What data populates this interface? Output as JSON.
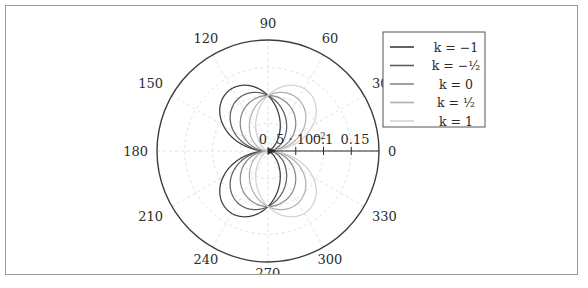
{
  "figure": {
    "type": "polar-plot",
    "background": "#ffffff",
    "frame_color": "#9a9a9a"
  },
  "chart_data": {
    "type": "line",
    "subtype": "polar",
    "title": "",
    "xlabel": "",
    "ylabel": "",
    "grid": true,
    "legend_position": "top-right",
    "polar": {
      "center_x": 267,
      "center_y": 150,
      "outer_radius": 111,
      "r_max": 0.2,
      "angle_direction": "counterclockwise",
      "angle_zero_at": "east"
    },
    "angle_ticks_deg": [
      0,
      30,
      60,
      90,
      120,
      150,
      180,
      210,
      240,
      270,
      300,
      330
    ],
    "angle_tick_labels": [
      "0",
      "30",
      "60",
      "90",
      "120",
      "150",
      "180",
      "210",
      "240",
      "270",
      "300",
      "330"
    ],
    "radial_ticks": [
      0,
      0.05,
      0.1,
      0.15
    ],
    "radial_tick_labels": [
      "0",
      "5 · 10⁻²",
      "0.1",
      "0.15"
    ],
    "radial_tick_label_parts": [
      {
        "text": "0"
      },
      {
        "mantissa": "5 · 10",
        "exponent": "−2"
      },
      {
        "text": "0.1"
      },
      {
        "text": "0.15"
      }
    ],
    "series": [
      {
        "name": "k = -1",
        "legend_label": "k = −1",
        "k": -1,
        "color": "#3d3d3d",
        "amplitude": 0.1,
        "description": "cardioid opening toward 180 degrees, largest lobe"
      },
      {
        "name": "k = -1/2",
        "legend_label": "k = −¹⁄₂",
        "k": -0.5,
        "color": "#5f5f5f",
        "amplitude": 0.1,
        "description": "lobe toward 180 degrees, medium"
      },
      {
        "name": "k = 0",
        "legend_label": "k = 0",
        "k": 0,
        "color": "#888888",
        "amplitude": 0.1,
        "description": "symmetric figure-eight, circle pair"
      },
      {
        "name": "k = 1/2",
        "legend_label": "k = ¹⁄₂",
        "k": 0.5,
        "color": "#b0b0b0",
        "amplitude": 0.1,
        "description": "lobe toward 0 degrees, medium"
      },
      {
        "name": "k = 1",
        "legend_label": "k = 1",
        "k": 1,
        "color": "#d2d2d2",
        "amplitude": 0.1,
        "description": "cardioid opening toward 0 degrees, largest lobe"
      }
    ],
    "legend_entries": [
      {
        "label_k": "k",
        "label_eq": "=",
        "label_val": "−1"
      },
      {
        "label_k": "k",
        "label_eq": "=",
        "label_val": "−¹⁄₂"
      },
      {
        "label_k": "k",
        "label_eq": "=",
        "label_val": "0"
      },
      {
        "label_k": "k",
        "label_eq": "=",
        "label_val": "¹⁄₂"
      },
      {
        "label_k": "k",
        "label_eq": "=",
        "label_val": "1"
      }
    ]
  },
  "legend": {
    "box_color": "#555555",
    "items": [
      {
        "text": "k = −1"
      },
      {
        "text": "k = −¹⁄₂"
      },
      {
        "text": "k = 0"
      },
      {
        "text": "k = ¹⁄₂"
      },
      {
        "text": "k = 1"
      }
    ]
  },
  "angles": {
    "a0": "0",
    "a30": "30",
    "a60": "60",
    "a90": "90",
    "a120": "120",
    "a150": "150",
    "a180": "180",
    "a210": "210",
    "a240": "240",
    "a270": "270",
    "a300": "300",
    "a330": "330"
  },
  "radial": {
    "t0": "0",
    "t1_mantissa": "5 · 10",
    "t1_exp": "−2",
    "t2": "0.1",
    "t3": "0.15"
  }
}
